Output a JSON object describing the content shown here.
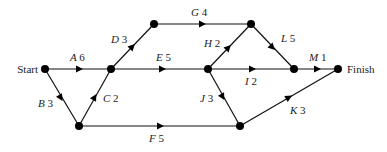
{
  "diagram": {
    "type": "activity-network",
    "start_label": "Start",
    "finish_label": "Finish",
    "nodes": [
      {
        "id": "start",
        "x": 45,
        "y": 69
      },
      {
        "id": "n1",
        "x": 111,
        "y": 69
      },
      {
        "id": "n2",
        "x": 79,
        "y": 126
      },
      {
        "id": "n3",
        "x": 154,
        "y": 24
      },
      {
        "id": "n4",
        "x": 251,
        "y": 24
      },
      {
        "id": "n5",
        "x": 208,
        "y": 69
      },
      {
        "id": "n6",
        "x": 294,
        "y": 69
      },
      {
        "id": "finish",
        "x": 338,
        "y": 69
      },
      {
        "id": "n7",
        "x": 240,
        "y": 126
      }
    ],
    "edges": [
      {
        "activity": "A",
        "duration": "6",
        "from": "start",
        "to": "n1"
      },
      {
        "activity": "B",
        "duration": "3",
        "from": "start",
        "to": "n2"
      },
      {
        "activity": "C",
        "duration": "2",
        "from": "n2",
        "to": "n1"
      },
      {
        "activity": "D",
        "duration": "3",
        "from": "n1",
        "to": "n3"
      },
      {
        "activity": "E",
        "duration": "5",
        "from": "n1",
        "to": "n5"
      },
      {
        "activity": "F",
        "duration": "5",
        "from": "n2",
        "to": "n7"
      },
      {
        "activity": "G",
        "duration": "4",
        "from": "n3",
        "to": "n4"
      },
      {
        "activity": "H",
        "duration": "2",
        "from": "n5",
        "to": "n4"
      },
      {
        "activity": "I",
        "duration": "2",
        "from": "n5",
        "to": "n6"
      },
      {
        "activity": "J",
        "duration": "3",
        "from": "n5",
        "to": "n7"
      },
      {
        "activity": "K",
        "duration": "3",
        "from": "n7",
        "to": "finish"
      },
      {
        "activity": "L",
        "duration": "5",
        "from": "n4",
        "to": "n6"
      },
      {
        "activity": "M",
        "duration": "1",
        "from": "n6",
        "to": "finish"
      }
    ]
  }
}
